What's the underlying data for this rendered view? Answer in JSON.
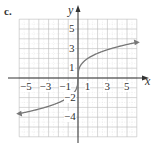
{
  "part_label": "c.",
  "chart_data": {
    "type": "line",
    "title": "",
    "xlabel": "x",
    "ylabel": "y",
    "xlim": [
      -6,
      6
    ],
    "ylim": [
      -6,
      6
    ],
    "grid": true,
    "x_ticks": [
      -5,
      -3,
      -1,
      1,
      3,
      5
    ],
    "x_tick_labels": [
      "−5",
      "−3",
      "−1",
      "1",
      "3",
      "5"
    ],
    "y_ticks": [
      5,
      3,
      1,
      -2,
      -4
    ],
    "y_tick_labels": [
      "5",
      "3",
      "1",
      "−2",
      "−4"
    ],
    "series": [
      {
        "name": "y = 2∛x",
        "x": [
          -6,
          -5,
          -4,
          -3,
          -2,
          -1,
          -0.5,
          -0.1,
          0,
          0.1,
          0.5,
          1,
          2,
          3,
          4,
          5,
          6
        ],
        "values": [
          -3.63,
          -3.42,
          -3.17,
          -2.88,
          -2.52,
          -2.0,
          -1.59,
          -0.93,
          0,
          0.93,
          1.59,
          2.0,
          2.52,
          2.88,
          3.17,
          3.42,
          3.63
        ],
        "arrows": "both"
      }
    ],
    "colors": {
      "curve": "#777777",
      "axes": "#333333",
      "grid": "#bbbbbb"
    }
  }
}
